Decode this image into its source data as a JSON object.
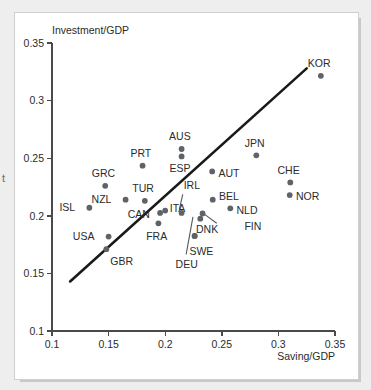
{
  "chart_data": {
    "type": "scatter",
    "title": "",
    "xlabel": "Saving/GDP",
    "ylabel": "Investment/GDP",
    "xlim": [
      0.1,
      0.35
    ],
    "ylim": [
      0.1,
      0.35
    ],
    "xticks": [
      "0.1",
      "0.15",
      "0.2",
      "0.25",
      "0.3",
      "0.35"
    ],
    "yticks": [
      "0.1",
      "0.15",
      "0.2",
      "0.25",
      "0.3",
      "0.35"
    ],
    "xtick_values": [
      0.1,
      0.15,
      0.2,
      0.25,
      0.3,
      0.35
    ],
    "ytick_values": [
      0.1,
      0.15,
      0.2,
      0.25,
      0.3,
      0.35
    ],
    "grid": false,
    "legend": "none",
    "marker_color": "#5f6368",
    "fit_line_color": "#1a1a1a",
    "fit_line": {
      "x0": 0.116,
      "y0": 0.143,
      "x1": 0.325,
      "y1": 0.328
    },
    "points": [
      {
        "label": "ISL",
        "x": 0.133,
        "y": 0.207,
        "lx": -0.0125,
        "ly": 0.0005,
        "anchor": "end"
      },
      {
        "label": "NZL",
        "x": 0.165,
        "y": 0.214,
        "lx": -0.0125,
        "ly": 0.0005,
        "anchor": "end"
      },
      {
        "label": "GRC",
        "x": 0.147,
        "y": 0.226,
        "lx": -0.0015,
        "ly": 0.0105,
        "anchor": "middle"
      },
      {
        "label": "USA",
        "x": 0.15,
        "y": 0.182,
        "lx": -0.0125,
        "ly": 0.0005,
        "anchor": "end"
      },
      {
        "label": "GBR",
        "x": 0.148,
        "y": 0.171,
        "lx": 0.0035,
        "ly": -0.0105,
        "anchor": "start"
      },
      {
        "label": "TUR",
        "x": 0.182,
        "y": 0.213,
        "lx": -0.0015,
        "ly": 0.0105,
        "anchor": "middle"
      },
      {
        "label": "CAN",
        "x": 0.1955,
        "y": 0.2025,
        "lx": -0.009,
        "ly": -0.001,
        "anchor": "end"
      },
      {
        "label": "PRT",
        "x": 0.18,
        "y": 0.2435,
        "lx": -0.0015,
        "ly": 0.0105,
        "anchor": "middle"
      },
      {
        "label": "FRA",
        "x": 0.194,
        "y": 0.1935,
        "lx": -0.0015,
        "ly": -0.011,
        "anchor": "middle"
      },
      {
        "label": "ITA",
        "x": 0.2,
        "y": 0.2045,
        "lx": 0.004,
        "ly": 0.002,
        "anchor": "start"
      },
      {
        "label": "AUS",
        "x": 0.2145,
        "y": 0.258,
        "lx": -0.0015,
        "ly": 0.0105,
        "anchor": "middle"
      },
      {
        "label": "ESP",
        "x": 0.2145,
        "y": 0.2515,
        "lx": -0.0015,
        "ly": -0.0105,
        "anchor": "middle"
      },
      {
        "label": "IRL",
        "x": 0.2145,
        "y": 0.2025,
        "lx": 0.009,
        "ly": 0.0235,
        "anchor": "middle"
      },
      {
        "label": "DEU",
        "x": 0.226,
        "y": 0.1825,
        "lx": -0.007,
        "ly": -0.025,
        "anchor": "middle"
      },
      {
        "label": "SWE",
        "x": 0.226,
        "y": 0.1825,
        "lx": 0.006,
        "ly": -0.013,
        "anchor": "middle"
      },
      {
        "label": "DNK",
        "x": 0.231,
        "y": 0.1975,
        "lx": 0.006,
        "ly": -0.0095,
        "anchor": "middle"
      },
      {
        "label": "FIN",
        "x": 0.233,
        "y": 0.202,
        "lx": 0.037,
        "ly": -0.011,
        "anchor": "start"
      },
      {
        "label": "AUT",
        "x": 0.2415,
        "y": 0.2385,
        "lx": 0.0055,
        "ly": -0.0015,
        "anchor": "start"
      },
      {
        "label": "BEL",
        "x": 0.242,
        "y": 0.214,
        "lx": 0.0055,
        "ly": 0.0025,
        "anchor": "start"
      },
      {
        "label": "NLD",
        "x": 0.2575,
        "y": 0.2065,
        "lx": 0.0055,
        "ly": -0.0015,
        "anchor": "start"
      },
      {
        "label": "JPN",
        "x": 0.2805,
        "y": 0.2525,
        "lx": -0.0015,
        "ly": 0.0105,
        "anchor": "middle"
      },
      {
        "label": "CHE",
        "x": 0.3105,
        "y": 0.229,
        "lx": -0.0015,
        "ly": 0.0105,
        "anchor": "middle"
      },
      {
        "label": "NOR",
        "x": 0.31,
        "y": 0.218,
        "lx": 0.0055,
        "ly": -0.0015,
        "anchor": "start"
      },
      {
        "label": "KOR",
        "x": 0.3375,
        "y": 0.3215,
        "lx": -0.0015,
        "ly": 0.011,
        "anchor": "middle"
      }
    ],
    "leader_lines": [
      {
        "name": "irl-leader",
        "x0": 0.2155,
        "y0": 0.2185,
        "x1": 0.2125,
        "y1": 0.2055
      },
      {
        "name": "deu-leader",
        "x0": 0.2185,
        "y0": 0.1665,
        "x1": 0.2245,
        "y1": 0.199
      },
      {
        "name": "fin-leader",
        "x0": 0.2455,
        "y0": 0.1935,
        "x1": 0.2345,
        "y1": 0.2015
      }
    ]
  },
  "edge_fragment": "t"
}
